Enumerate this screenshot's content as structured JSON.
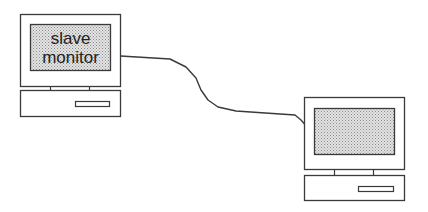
{
  "diagram": {
    "type": "network-connection",
    "nodes": [
      {
        "id": "slave",
        "label_lines": [
          "slave",
          "monitor"
        ],
        "role": "slave monitor"
      },
      {
        "id": "master",
        "label_lines": [],
        "role": "monitor"
      }
    ],
    "edges": [
      {
        "from": "slave",
        "to": "master",
        "style": "cable"
      }
    ]
  },
  "colors": {
    "stroke": "#3a3a3a",
    "screen_fill": "#c8c8c8",
    "background": "#ffffff"
  }
}
